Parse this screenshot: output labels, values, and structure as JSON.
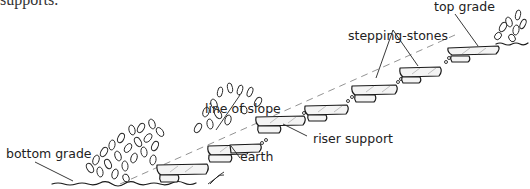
{
  "caption_fragment": "supports.",
  "diagram": {
    "labels": {
      "top_grade": "top grade",
      "stepping_stones": "stepping-stones",
      "line_of_slope": "line of slope",
      "riser_support": "riser support",
      "earth": "earth",
      "bottom_grade": "bottom grade"
    },
    "step_count": 6,
    "colors": {
      "ink": "#1a1a1a",
      "stone_fill": "#f4f4f4",
      "slope_line": "#777777",
      "background": "#ffffff"
    }
  }
}
